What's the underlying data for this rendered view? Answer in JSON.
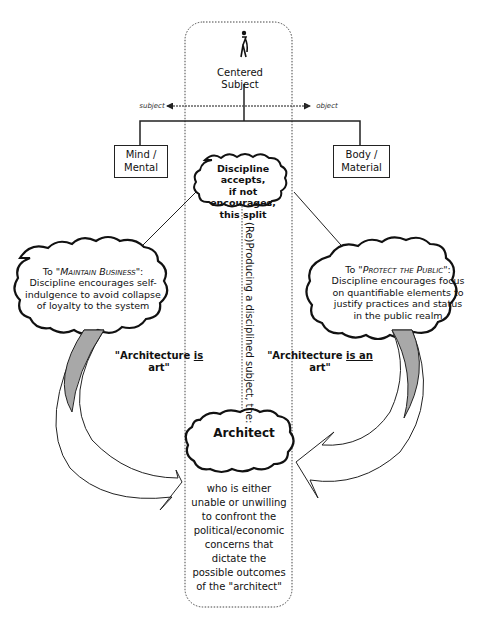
{
  "center_column": {
    "figure_icon": "person-walking-icon",
    "title": "Centered Subject",
    "axis_left_label": "subject",
    "axis_right_label": "object"
  },
  "split_boxes": {
    "left": {
      "line1": "Mind /",
      "line2": "Mental"
    },
    "right": {
      "line1": "Body /",
      "line2": "Material"
    }
  },
  "discipline_cloud": {
    "line1": "Discipline accepts,",
    "line2": "if not encourages,",
    "line3": "this split"
  },
  "left_cloud": {
    "heading_prefix": "To \"",
    "heading_caps": "Maintain Business",
    "heading_suffix": "\":",
    "line1": "Discipline encourages self-",
    "line2": "indulgence to avoid collapse",
    "line3": "of loyalty to the system"
  },
  "right_cloud": {
    "heading_prefix": "To \"",
    "heading_caps": "Protect the Public",
    "heading_suffix": "\":",
    "line1": "Discipline encourages focus",
    "line2": "on quantifiable elements to",
    "line3": "justify practices and status",
    "line4": "in the public realm"
  },
  "vertical_label": "(Re)Producing a disciplined subject, the:",
  "quote_left": {
    "pre": "\"Architecture ",
    "emph": "is",
    "post": " art\""
  },
  "quote_right": {
    "pre": "\"Architecture ",
    "emph": "is an",
    "post": " art\""
  },
  "architect_cloud": {
    "label": "Architect"
  },
  "architect_description": {
    "lines": [
      "who is either",
      "unable or unwilling",
      "to confront the",
      "political/economic",
      "concerns that",
      "dictate the",
      "possible outcomes",
      "of the \"architect\""
    ]
  },
  "colors": {
    "line": "#222222",
    "arrow_fill": "#a8a8a8",
    "dotted": "#444444"
  }
}
